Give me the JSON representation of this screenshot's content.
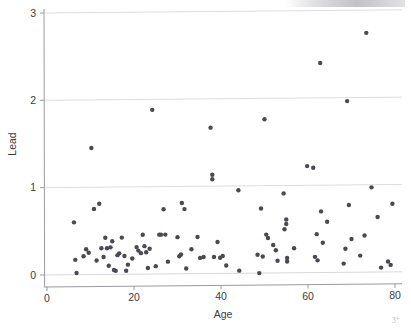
{
  "figure": {
    "background_color": "#ffffff",
    "point_color": "#4a4a52",
    "gridline_color": "#d9d9dd",
    "axis_color": "#9a9aa0",
    "text_color": "#3c3c42"
  },
  "axes": {
    "x_title": "Age",
    "y_title": "Lead",
    "x_ticks": [
      "0",
      "20",
      "40",
      "60",
      "80"
    ],
    "y_ticks": [
      "0",
      "1",
      "2",
      "3"
    ]
  },
  "artifacts": {
    "corner_mark": "ʒ+"
  },
  "chart_data": {
    "type": "scatter",
    "title": "",
    "xlabel": "Age",
    "ylabel": "Lead",
    "xlim": [
      0,
      82
    ],
    "ylim": [
      -0.06,
      3.0
    ],
    "xticks": [
      0,
      20,
      40,
      60,
      80
    ],
    "yticks": [
      0,
      1,
      2,
      3
    ],
    "grid": "horizontal",
    "legend": "none",
    "marker": {
      "shape": "circle",
      "size": 4.2,
      "color": "#4a4a52"
    },
    "series": [
      {
        "name": "Blood lead vs age",
        "points": [
          [
            6.2,
            0.6
          ],
          [
            6.8,
            0.02
          ],
          [
            6.5,
            0.17
          ],
          [
            8.4,
            0.21
          ],
          [
            9.0,
            0.29
          ],
          [
            9.6,
            0.25
          ],
          [
            10.2,
            1.45
          ],
          [
            10.8,
            0.75
          ],
          [
            11.4,
            0.16
          ],
          [
            12.0,
            0.81
          ],
          [
            12.5,
            0.3
          ],
          [
            13.0,
            0.2
          ],
          [
            13.4,
            0.42
          ],
          [
            13.8,
            0.3
          ],
          [
            14.2,
            0.1
          ],
          [
            14.6,
            0.31
          ],
          [
            15.0,
            0.38
          ],
          [
            15.4,
            0.05
          ],
          [
            15.8,
            0.04
          ],
          [
            16.2,
            0.22
          ],
          [
            16.6,
            0.24
          ],
          [
            17.2,
            0.42
          ],
          [
            17.8,
            0.21
          ],
          [
            18.2,
            0.04
          ],
          [
            18.6,
            0.11
          ],
          [
            19.6,
            0.18
          ],
          [
            20.6,
            0.31
          ],
          [
            21.0,
            0.27
          ],
          [
            21.6,
            0.24
          ],
          [
            22.0,
            0.45
          ],
          [
            22.4,
            0.32
          ],
          [
            22.8,
            0.25
          ],
          [
            23.2,
            0.07
          ],
          [
            23.6,
            0.29
          ],
          [
            24.2,
            1.88
          ],
          [
            25.0,
            0.09
          ],
          [
            25.8,
            0.45
          ],
          [
            26.2,
            0.45
          ],
          [
            26.8,
            0.74
          ],
          [
            27.2,
            0.45
          ],
          [
            27.8,
            0.14
          ],
          [
            30.0,
            0.42
          ],
          [
            30.4,
            0.2
          ],
          [
            30.8,
            0.22
          ],
          [
            31.0,
            0.81
          ],
          [
            31.6,
            0.74
          ],
          [
            32.0,
            0.06
          ],
          [
            33.2,
            0.28
          ],
          [
            34.6,
            0.42
          ],
          [
            35.2,
            0.18
          ],
          [
            36.0,
            0.19
          ],
          [
            37.6,
            1.67
          ],
          [
            38.0,
            1.13
          ],
          [
            38.0,
            1.08
          ],
          [
            38.4,
            0.19
          ],
          [
            39.2,
            0.36
          ],
          [
            39.8,
            0.18
          ],
          [
            40.4,
            0.2
          ],
          [
            41.2,
            0.09
          ],
          [
            44.0,
            0.95
          ],
          [
            44.2,
            0.03
          ],
          [
            48.4,
            0.21
          ],
          [
            48.8,
            0.0
          ],
          [
            49.2,
            0.74
          ],
          [
            49.6,
            0.19
          ],
          [
            50.0,
            1.76
          ],
          [
            50.4,
            0.44
          ],
          [
            50.8,
            0.4
          ],
          [
            52.0,
            0.32
          ],
          [
            52.6,
            0.26
          ],
          [
            53.0,
            0.14
          ],
          [
            54.4,
            0.91
          ],
          [
            54.6,
            0.5
          ],
          [
            55.0,
            0.61
          ],
          [
            55.0,
            0.56
          ],
          [
            55.2,
            0.17
          ],
          [
            55.2,
            0.13
          ],
          [
            56.8,
            0.28
          ],
          [
            59.8,
            1.22
          ],
          [
            61.2,
            1.2
          ],
          [
            61.6,
            0.18
          ],
          [
            62.0,
            0.44
          ],
          [
            62.2,
            0.14
          ],
          [
            62.8,
            2.4
          ],
          [
            63.0,
            0.7
          ],
          [
            63.4,
            0.34
          ],
          [
            64.4,
            0.58
          ],
          [
            68.2,
            0.1
          ],
          [
            68.6,
            0.27
          ],
          [
            69.0,
            1.96
          ],
          [
            69.4,
            0.77
          ],
          [
            70.0,
            0.38
          ],
          [
            72.0,
            0.19
          ],
          [
            73.0,
            0.42
          ],
          [
            73.4,
            2.74
          ],
          [
            74.6,
            0.97
          ],
          [
            76.0,
            0.63
          ],
          [
            76.8,
            0.05
          ],
          [
            78.4,
            0.12
          ],
          [
            79.0,
            0.08
          ],
          [
            79.4,
            0.78
          ]
        ]
      }
    ]
  }
}
